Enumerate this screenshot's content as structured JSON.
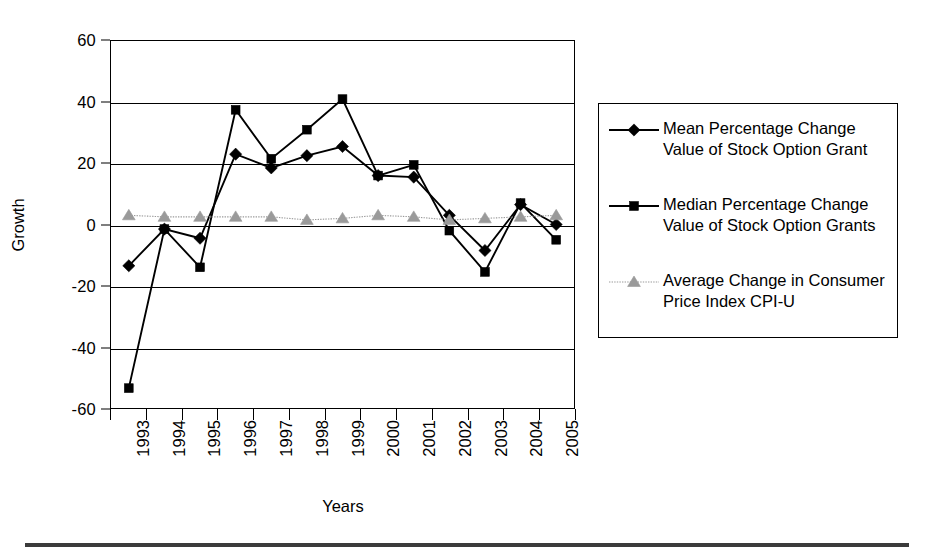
{
  "chart_data": {
    "type": "line",
    "title": "",
    "xlabel": "Years",
    "ylabel": "Growth",
    "ylim": [
      -60,
      60
    ],
    "ytick_values": [
      60,
      40,
      20,
      0,
      -20,
      -40,
      -60
    ],
    "ytick_labels": [
      "60",
      "40",
      "20",
      "0",
      "-20",
      "-40",
      "-60"
    ],
    "grid": true,
    "legend_position": "right",
    "categories": [
      "1993",
      "1994",
      "1995",
      "1996",
      "1997",
      "1998",
      "1999",
      "2000",
      "2001",
      "2002",
      "2003",
      "2004",
      "2005"
    ],
    "series": [
      {
        "name": "Mean Percentage Change\nValue of Stock Option Grant",
        "marker": "diamond",
        "color": "#000000",
        "values": [
          -13.5,
          -1.5,
          -4.5,
          23,
          18.5,
          22.5,
          25.5,
          16,
          15.5,
          3,
          -8.5,
          6.5,
          0
        ]
      },
      {
        "name": "Median Percentage Change\nValue of Stock Option Grants",
        "marker": "square",
        "color": "#000000",
        "values": [
          -53.5,
          -1.5,
          -14,
          37.5,
          21.5,
          31,
          41,
          16,
          19.5,
          -2,
          -15.5,
          7,
          -5
        ]
      },
      {
        "name": "Average Change in Consumer\nPrice Index CPI-U",
        "marker": "triangle",
        "color": "#9a9a9a",
        "values": [
          3,
          2.5,
          2.5,
          2.5,
          2.5,
          1.5,
          2,
          3,
          2.5,
          1.5,
          2,
          2.5,
          3
        ]
      }
    ]
  },
  "axis": {
    "y_title": "Growth",
    "x_title": "Years"
  },
  "legend": {
    "entries": [
      {
        "label": "Mean Percentage Change\nValue of Stock Option Grant",
        "marker": "diamond-marker-icon"
      },
      {
        "label": "Median Percentage Change\nValue of Stock Option Grants",
        "marker": "square-marker-icon"
      },
      {
        "label": "Average Change in Consumer\nPrice Index CPI-U",
        "marker": "triangle-marker-icon"
      }
    ]
  }
}
